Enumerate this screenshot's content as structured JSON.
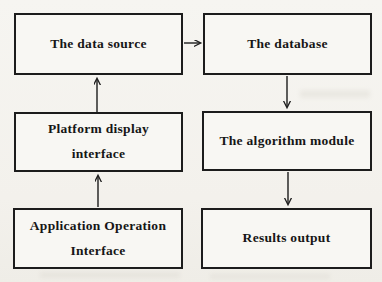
{
  "diagram": {
    "nodes": [
      {
        "id": "data-source",
        "label": "The data source"
      },
      {
        "id": "database",
        "label": "The database"
      },
      {
        "id": "platform-display-interface",
        "lines": [
          "Platform display",
          "interface"
        ]
      },
      {
        "id": "algorithm-module",
        "label": "The algorithm module"
      },
      {
        "id": "application-operation-interface",
        "lines": [
          "Application Operation",
          "Interface"
        ]
      },
      {
        "id": "results-output",
        "label": "Results output"
      }
    ],
    "edges": [
      {
        "from": "The data source",
        "to": "The database",
        "direction": "right"
      },
      {
        "from": "The database",
        "to": "The algorithm module",
        "direction": "down"
      },
      {
        "from": "The algorithm module",
        "to": "Results output",
        "direction": "down"
      },
      {
        "from": "Platform display interface",
        "to": "The data source",
        "direction": "up"
      },
      {
        "from": "Application Operation Interface",
        "to": "Platform display interface",
        "direction": "up"
      }
    ],
    "colors": {
      "background": "#f4f2ed",
      "box_fill": "#f8f7f3",
      "border": "#1c1c1c",
      "text": "#161616"
    }
  }
}
